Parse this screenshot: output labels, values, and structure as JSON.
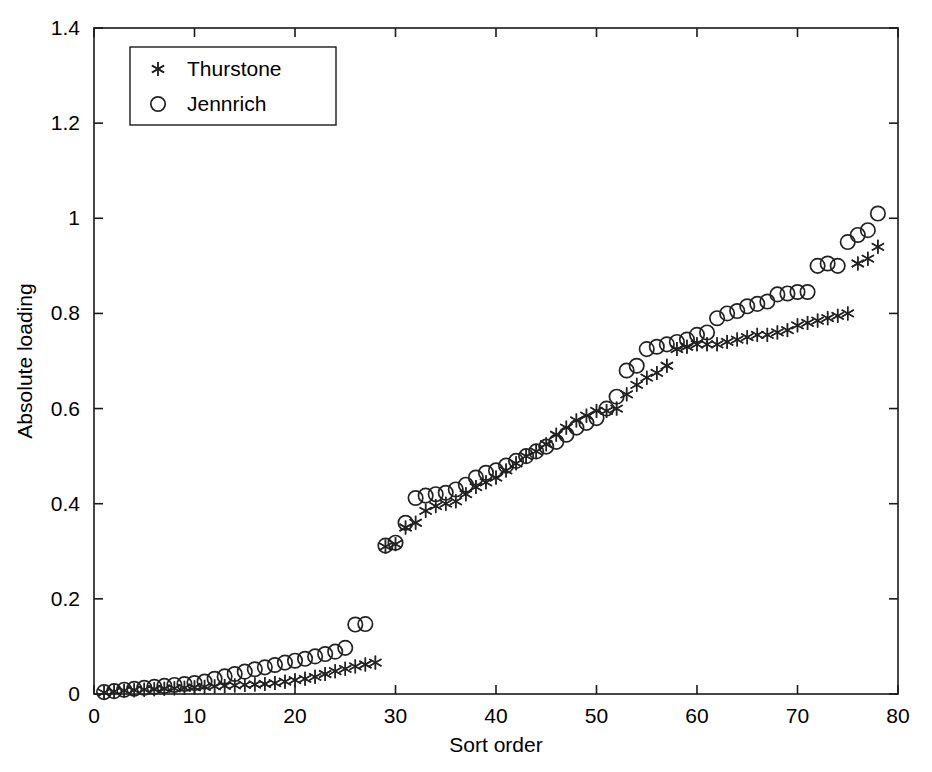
{
  "figure": {
    "background": "#ffffff",
    "foreground": "#1a1a1a"
  },
  "axes": {
    "xlabel": "Sort order",
    "ylabel": "Absolute loading",
    "x_ticks": [
      "0",
      "10",
      "20",
      "30",
      "40",
      "50",
      "60",
      "70",
      "80"
    ],
    "y_ticks": [
      "0",
      "0.2",
      "0.4",
      "0.6",
      "0.8",
      "1",
      "1.2",
      "1.4"
    ]
  },
  "legend": {
    "entries": [
      {
        "label": "Thurstone",
        "marker": "star-marker"
      },
      {
        "label": "Jennrich",
        "marker": "circle-marker"
      }
    ]
  },
  "chart_data": {
    "type": "scatter",
    "title": "",
    "xlabel": "Sort order",
    "ylabel": "Absolute loading",
    "xlim": [
      0,
      80
    ],
    "ylim": [
      0,
      1.4
    ],
    "xticks": [
      0,
      10,
      20,
      30,
      40,
      50,
      60,
      70,
      80
    ],
    "yticks": [
      0,
      0.2,
      0.4,
      0.6,
      0.8,
      1.0,
      1.2,
      1.4
    ],
    "grid": false,
    "legend_position": "upper-left-inside",
    "x": [
      1,
      2,
      3,
      4,
      5,
      6,
      7,
      8,
      9,
      10,
      11,
      12,
      13,
      14,
      15,
      16,
      17,
      18,
      19,
      20,
      21,
      22,
      23,
      24,
      25,
      26,
      27,
      28,
      29,
      30,
      31,
      32,
      33,
      34,
      35,
      36,
      37,
      38,
      39,
      40,
      41,
      42,
      43,
      44,
      45,
      46,
      47,
      48,
      49,
      50,
      51,
      52,
      53,
      54,
      55,
      56,
      57,
      58,
      59,
      60,
      61,
      62,
      63,
      64,
      65,
      66,
      67,
      68,
      69,
      70,
      71,
      72,
      73,
      74,
      75,
      76,
      77,
      78
    ],
    "series": [
      {
        "name": "Thurstone",
        "marker": "star",
        "values": [
          0.003,
          0.005,
          0.007,
          0.008,
          0.009,
          0.01,
          0.011,
          0.012,
          0.013,
          0.014,
          0.015,
          0.016,
          0.017,
          0.018,
          0.019,
          0.02,
          0.021,
          0.023,
          0.026,
          0.029,
          0.032,
          0.036,
          0.042,
          0.048,
          0.053,
          0.058,
          0.062,
          0.066,
          0.31,
          0.315,
          0.35,
          0.36,
          0.385,
          0.395,
          0.4,
          0.405,
          0.42,
          0.435,
          0.445,
          0.455,
          0.47,
          0.485,
          0.5,
          0.51,
          0.525,
          0.545,
          0.56,
          0.575,
          0.585,
          0.595,
          0.595,
          0.6,
          0.63,
          0.65,
          0.665,
          0.675,
          0.69,
          0.725,
          0.73,
          0.735,
          0.735,
          0.735,
          0.74,
          0.745,
          0.75,
          0.755,
          0.755,
          0.76,
          0.765,
          0.775,
          0.78,
          0.785,
          0.79,
          0.795,
          0.8,
          0.905,
          0.915,
          0.94
        ]
      },
      {
        "name": "Jennrich",
        "marker": "circle",
        "values": [
          0.004,
          0.006,
          0.009,
          0.011,
          0.013,
          0.015,
          0.017,
          0.019,
          0.021,
          0.023,
          0.026,
          0.032,
          0.037,
          0.042,
          0.047,
          0.052,
          0.056,
          0.061,
          0.066,
          0.07,
          0.074,
          0.079,
          0.084,
          0.089,
          0.097,
          0.146,
          0.147,
          0.0,
          0.312,
          0.318,
          0.36,
          0.412,
          0.417,
          0.42,
          0.423,
          0.43,
          0.44,
          0.455,
          0.465,
          0.47,
          0.48,
          0.49,
          0.5,
          0.51,
          0.52,
          0.53,
          0.545,
          0.56,
          0.57,
          0.58,
          0.6,
          0.625,
          0.68,
          0.69,
          0.725,
          0.73,
          0.735,
          0.74,
          0.745,
          0.755,
          0.76,
          0.79,
          0.8,
          0.805,
          0.815,
          0.82,
          0.825,
          0.84,
          0.842,
          0.845,
          0.845,
          0.9,
          0.905,
          0.9,
          0.95,
          0.965,
          0.975,
          1.01
        ]
      }
    ]
  }
}
